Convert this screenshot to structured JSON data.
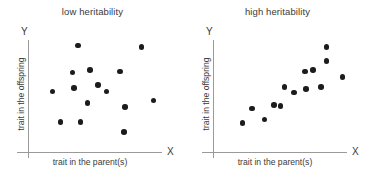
{
  "figure": {
    "background": "#ffffff",
    "dot_color": "#1c1c1c",
    "axis_color": "#9a9a9a",
    "text_color": "#3a3a3a"
  },
  "chart_data": [
    {
      "type": "scatter",
      "title": "low heritability",
      "xlabel": "trait in the parent(s)",
      "ylabel": "trait in the offspring",
      "x_axis_letter": "X",
      "y_axis_letter": "Y",
      "grid": false,
      "legend": "none",
      "xlim": [
        0,
        100
      ],
      "ylim": [
        0,
        100
      ],
      "ticks": false,
      "points": [
        {
          "x": 37,
          "y": 95
        },
        {
          "x": 84,
          "y": 94
        },
        {
          "x": 33,
          "y": 71
        },
        {
          "x": 46,
          "y": 73
        },
        {
          "x": 68,
          "y": 72
        },
        {
          "x": 18,
          "y": 54
        },
        {
          "x": 34,
          "y": 57
        },
        {
          "x": 52,
          "y": 60
        },
        {
          "x": 58,
          "y": 54
        },
        {
          "x": 44,
          "y": 44
        },
        {
          "x": 72,
          "y": 40
        },
        {
          "x": 93,
          "y": 46
        },
        {
          "x": 24,
          "y": 27
        },
        {
          "x": 39,
          "y": 27
        },
        {
          "x": 71,
          "y": 18
        }
      ]
    },
    {
      "type": "scatter",
      "title": "high heritability",
      "xlabel": "trait in the parent(s)",
      "ylabel": "trait in the offspring",
      "x_axis_letter": "X",
      "y_axis_letter": "Y",
      "grid": false,
      "legend": "none",
      "xlim": [
        0,
        100
      ],
      "ylim": [
        0,
        100
      ],
      "ticks": false,
      "points": [
        {
          "x": 84,
          "y": 94
        },
        {
          "x": 84,
          "y": 81
        },
        {
          "x": 68,
          "y": 72
        },
        {
          "x": 74,
          "y": 73
        },
        {
          "x": 96,
          "y": 67
        },
        {
          "x": 53,
          "y": 58
        },
        {
          "x": 60,
          "y": 53
        },
        {
          "x": 69,
          "y": 56
        },
        {
          "x": 80,
          "y": 58
        },
        {
          "x": 45,
          "y": 42
        },
        {
          "x": 50,
          "y": 41
        },
        {
          "x": 29,
          "y": 39
        },
        {
          "x": 38,
          "y": 29
        },
        {
          "x": 22,
          "y": 26
        }
      ]
    }
  ]
}
